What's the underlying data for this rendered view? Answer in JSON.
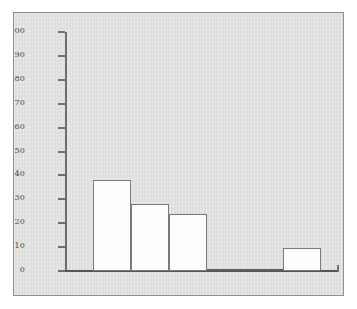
{
  "figure": {
    "panel_background": "#dddddd",
    "panel_border_color": "#8f8f8f",
    "bar_fill": "#fdfdfd",
    "bar_edge": "#7a7a7a",
    "axis_color": "#6e6e6e",
    "tick_label_color": "#4a4a4a"
  },
  "chart_data": {
    "type": "bar",
    "title": "",
    "subtitle": "",
    "xlabel": "",
    "ylabel": "",
    "categories": [
      "1",
      "2",
      "3",
      "4",
      "5",
      "6"
    ],
    "values": [
      38,
      28,
      24,
      0.5,
      0,
      9.5
    ],
    "ylim": [
      0,
      100
    ],
    "yticks": [
      0,
      10,
      20,
      30,
      40,
      50,
      60,
      70,
      80,
      90,
      100
    ],
    "ytick_labels": [
      "0",
      "10",
      "20",
      "30",
      "40",
      "50",
      "60",
      "70",
      "80",
      "90",
      "100"
    ],
    "xtick_labels": [],
    "grid": false,
    "legend": false,
    "legend_position": "none",
    "annotations": [],
    "bars_contiguous": true
  }
}
